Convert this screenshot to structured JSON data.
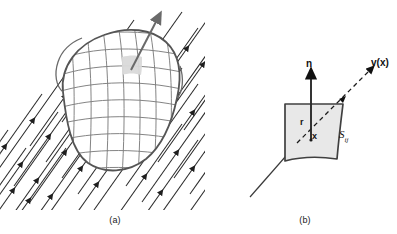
{
  "figure": {
    "width": 397,
    "height": 234,
    "background": "#ffffff"
  },
  "panels": [
    {
      "id": "a",
      "caption": "(a)",
      "description": "Uniform flow field of parallel streamlines with arrowheads passing around a closed meshed blob surface",
      "streamline_count": 22,
      "streamline_angle_deg": -55,
      "blob": {
        "mesh_rows": 9,
        "mesh_cols": 9,
        "outline_color": "#555555",
        "mesh_color": "#808080",
        "highlight_cell_fill": "#d9d9d9"
      },
      "callout_arrow": "surface-element-normal"
    },
    {
      "id": "b",
      "caption": "(b)",
      "description": "Detail of a single curved surface element with outward normal vector and local velocity vector",
      "patch": {
        "label": "S",
        "label_subscript": "ij",
        "fill": "#e8e8e8",
        "stroke": "#404040"
      },
      "vectors": [
        {
          "name": "normal",
          "label": "n",
          "direction": "up"
        },
        {
          "name": "velocity",
          "label": "v(x)",
          "direction": "upper-right",
          "style": "dashed"
        },
        {
          "name": "position-tail",
          "label": "r"
        },
        {
          "name": "point",
          "label": "x"
        }
      ]
    }
  ],
  "labels": {
    "caption_a": "(a)",
    "caption_b": "(b)",
    "normal": "n",
    "velocity": "v(x)",
    "radius": "r",
    "point": "x",
    "surface": "S",
    "surface_sub": "ij"
  },
  "colors": {
    "stroke_dark": "#222222",
    "stroke_mid": "#555555",
    "mesh": "#7d7d7d",
    "patch_fill": "#e8e8e8",
    "highlight": "#d9d9d9",
    "text": "#111111"
  }
}
